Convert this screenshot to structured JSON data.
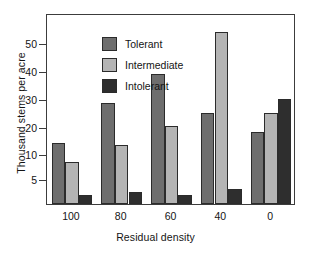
{
  "chart_data": {
    "type": "bar",
    "title": "",
    "subtitle": "",
    "xlabel": "Residual density",
    "ylabel": "Thousand stems per acre",
    "categories": [
      "100",
      "80",
      "60",
      "40",
      "0"
    ],
    "series": [
      {
        "name": "Tolerant",
        "color": "#6e6e6e",
        "values": [
          14,
          28.7,
          39,
          25,
          18
        ]
      },
      {
        "name": "Intermediate",
        "color": "#b4b4b4",
        "values": [
          8.5,
          13.2,
          20.3,
          54,
          25
        ]
      },
      {
        "name": "Intolerant",
        "color": "#2e2e2e",
        "values": [
          1.8,
          2.5,
          1.9,
          3.0,
          30
        ]
      }
    ],
    "ytick_values": [
      5,
      10,
      20,
      30,
      40,
      50
    ],
    "ytick_labels": [
      "5",
      "10",
      "20",
      "30",
      "40",
      "50"
    ],
    "ylim": [
      0,
      56
    ],
    "grid": false,
    "legend_position": "top-left",
    "frame": true,
    "axis_color": "#3c3c3c",
    "background": "#ffffff"
  },
  "legend": {
    "items": [
      {
        "label": "Tolerant"
      },
      {
        "label": "Intermediate"
      },
      {
        "label": "Intolerant"
      }
    ]
  },
  "axes": {
    "y_title": "Thousand stems per acre",
    "x_title": "Residual density"
  }
}
